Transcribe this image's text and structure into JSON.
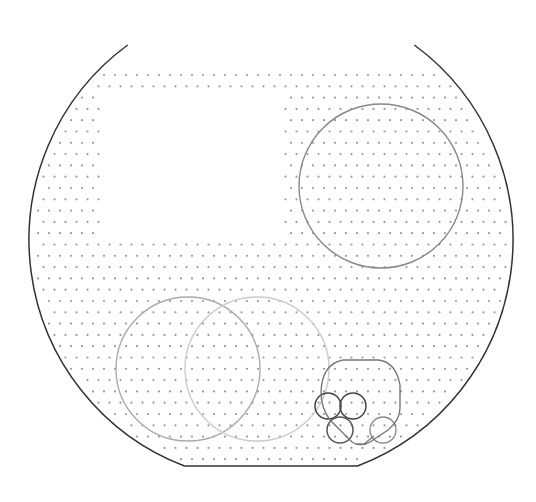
{
  "canvas": {
    "width": 536,
    "height": 502,
    "background": "#ffffff"
  },
  "boundary": {
    "center": [
      271,
      240
    ],
    "radius": 242,
    "top_cut_y": 45,
    "bottom_flat_y": 466,
    "bottom_chamfer_x": [
      186,
      354
    ],
    "stroke": "#333333",
    "stroke_width": 1.5
  },
  "dot_grid": {
    "x_start": 38,
    "y_start": 75,
    "dx": 11,
    "dy": 11.3,
    "stagger": 5.5,
    "dot_radius": 1.1,
    "color": "#9a9a9a",
    "exclusion_rect": {
      "x": 100,
      "y": 97,
      "w": 183,
      "h": 143
    }
  },
  "shapes": {
    "circles": [
      {
        "name": "large-circle-top-right",
        "cx": 381,
        "cy": 186,
        "r": 82,
        "stroke": "#888888",
        "width": 1.4
      },
      {
        "name": "circle-bottom-left",
        "cx": 188,
        "cy": 369,
        "r": 72,
        "stroke": "#aaaaaa",
        "width": 1.4
      },
      {
        "name": "circle-bottom-middle",
        "cx": 257,
        "cy": 369,
        "r": 72,
        "stroke": "#cccccc",
        "width": 1.4
      },
      {
        "name": "small-circle-a",
        "cx": 328,
        "cy": 406,
        "r": 13,
        "stroke": "#444444",
        "width": 1.5
      },
      {
        "name": "small-circle-b",
        "cx": 353,
        "cy": 406,
        "r": 13,
        "stroke": "#444444",
        "width": 1.5
      },
      {
        "name": "small-circle-c",
        "cx": 340,
        "cy": 430,
        "r": 13,
        "stroke": "#555555",
        "width": 1.5
      },
      {
        "name": "small-circle-d",
        "cx": 383,
        "cy": 430,
        "r": 13,
        "stroke": "#888888",
        "width": 1.3
      }
    ],
    "rounded_outline": {
      "path": "M 343 360 L 378 360 Q 396 362 400 385 L 400 408 Q 400 420 388 430 L 370 442 Q 364 446 356 444 L 362 444 L 360 444 M 343 360 Q 322 364 321 392 Q 321 408 330 420 L 352 442 Q 358 446 364 444 L 374 436",
      "stroke": "#777777",
      "width": 1.4
    }
  }
}
